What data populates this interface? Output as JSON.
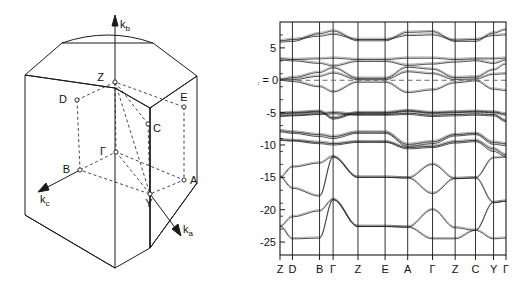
{
  "figure": {
    "panels": [
      "brillouin-zone",
      "band-structure"
    ]
  },
  "brillouin_zone": {
    "axes": [
      {
        "name": "kb",
        "base": "k",
        "sub": "b",
        "label": "k"
      },
      {
        "name": "kc",
        "base": "k",
        "sub": "c",
        "label": "k"
      },
      {
        "name": "ka",
        "base": "k",
        "sub": "a",
        "label": "k"
      }
    ],
    "axis_labels": {
      "kb": "k",
      "kb_sub": "b",
      "kc": "k",
      "kc_sub": "c",
      "ka": "k",
      "ka_sub": "a"
    },
    "points": [
      {
        "name": "Z",
        "label": "Z",
        "x": 115,
        "y": 82,
        "lx": 105,
        "ly": 80
      },
      {
        "name": "D",
        "label": "D",
        "x": 77,
        "y": 100,
        "lx": 66,
        "ly": 100
      },
      {
        "name": "E",
        "label": "E",
        "x": 184,
        "y": 107,
        "lx": 181,
        "ly": 98
      },
      {
        "name": "C",
        "label": "C",
        "x": 148,
        "y": 124,
        "lx": 153,
        "ly": 128
      },
      {
        "name": "G",
        "label": "Γ",
        "x": 116,
        "y": 152,
        "lx": 106,
        "ly": 152
      },
      {
        "name": "B",
        "label": "B",
        "x": 80,
        "y": 170,
        "lx": 68,
        "ly": 169
      },
      {
        "name": "A",
        "label": "A",
        "x": 184,
        "y": 180,
        "lx": 189,
        "ly": 184
      },
      {
        "name": "Y",
        "label": "Y",
        "x": 150,
        "y": 194,
        "lx": 148,
        "ly": 206
      }
    ]
  },
  "chart_data": {
    "type": "line",
    "title": "",
    "xlabel": "",
    "ylabel": "",
    "ylim": [
      -27,
      9
    ],
    "grid": true,
    "legend_position": "none",
    "fermi_level_label": "E",
    "fermi_level_sub": "F",
    "fermi_level_eq": "= 0",
    "fermi_level_value": 0,
    "ytick_labels": [
      "5",
      "0",
      "-5",
      "-10",
      "-15",
      "-20",
      "-25"
    ],
    "ytick_values": [
      5,
      0,
      -5,
      -10,
      -15,
      -20,
      -25
    ],
    "yminor_values": [
      7,
      3,
      1,
      -1,
      -3,
      -7,
      -9,
      -11,
      -13,
      -17,
      -19,
      -21,
      -23
    ],
    "categories": [
      "Z",
      "D",
      "B",
      "Γ",
      "Z",
      "E",
      "A",
      "Γ",
      "Z",
      "C",
      "Y",
      "Γ"
    ],
    "xtick_positions": [
      0,
      0.055,
      0.175,
      0.235,
      0.345,
      0.465,
      0.565,
      0.675,
      0.775,
      0.865,
      0.945,
      1.0
    ],
    "series": [
      {
        "name": "band-1",
        "values": [
          -22.6,
          -24.5,
          -24.4,
          -18.5,
          -22.6,
          -22.6,
          -22.7,
          -24.5,
          -24.5,
          -23.2,
          -24.5,
          -24.4
        ]
      },
      {
        "name": "band-2",
        "values": [
          -22.6,
          -21.1,
          -20.2,
          -18.4,
          -22.6,
          -22.6,
          -22.7,
          -20.0,
          -22.8,
          -23.2,
          -18.9,
          -18.7
        ]
      },
      {
        "name": "band-3",
        "values": [
          -15.0,
          -16.7,
          -17.9,
          -11.9,
          -15.0,
          -15.0,
          -15.1,
          -17.5,
          -15.2,
          -15.1,
          -18.9,
          -18.7
        ]
      },
      {
        "name": "band-4",
        "values": [
          -15.0,
          -13.4,
          -12.8,
          -11.8,
          -15.0,
          -15.0,
          -15.1,
          -13.0,
          -15.2,
          -15.1,
          -12.0,
          -11.9
        ]
      },
      {
        "name": "band-5",
        "values": [
          -9.3,
          -9.4,
          -9.8,
          -10.0,
          -9.6,
          -9.6,
          -10.6,
          -10.4,
          -9.7,
          -9.5,
          -11.0,
          -11.8
        ]
      },
      {
        "name": "band-6",
        "values": [
          -9.2,
          -9.3,
          -9.6,
          -9.8,
          -9.5,
          -9.5,
          -10.4,
          -10.2,
          -9.5,
          -9.3,
          -10.6,
          -11.5
        ]
      },
      {
        "name": "band-7",
        "values": [
          -8.0,
          -8.2,
          -8.7,
          -9.0,
          -8.2,
          -8.2,
          -10.2,
          -9.8,
          -8.6,
          -8.4,
          -9.9,
          -10.1
        ]
      },
      {
        "name": "band-8",
        "values": [
          -7.8,
          -8.0,
          -8.4,
          -8.7,
          -8.0,
          -8.0,
          -9.9,
          -9.5,
          -8.4,
          -8.2,
          -9.6,
          -9.8
        ]
      },
      {
        "name": "band-9",
        "values": [
          -5.6,
          -5.5,
          -5.3,
          -5.2,
          -5.4,
          -5.4,
          -5.3,
          -5.6,
          -5.5,
          -5.4,
          -5.5,
          -6.4
        ]
      },
      {
        "name": "band-10",
        "values": [
          -5.5,
          -5.4,
          -5.2,
          -5.0,
          -5.3,
          -5.3,
          -5.1,
          -5.4,
          -5.3,
          -5.2,
          -5.3,
          -6.2
        ]
      },
      {
        "name": "band-11",
        "values": [
          -5.2,
          -5.1,
          -4.9,
          -6.0,
          -5.1,
          -5.1,
          -4.8,
          -5.1,
          -5.0,
          -4.9,
          -5.0,
          -5.4
        ]
      },
      {
        "name": "band-12",
        "values": [
          -5.1,
          -5.0,
          -4.8,
          -5.8,
          -5.0,
          -5.0,
          -4.7,
          -5.0,
          -4.9,
          -4.8,
          -4.9,
          -5.2
        ]
      },
      {
        "name": "band-13",
        "values": [
          0.0,
          -0.2,
          -1.0,
          -1.8,
          -0.3,
          -0.3,
          -1.9,
          -1.5,
          -0.4,
          -0.1,
          -1.4,
          -1.6
        ]
      },
      {
        "name": "band-14",
        "values": [
          0.0,
          0.1,
          0.6,
          1.1,
          0.1,
          0.1,
          1.3,
          1.0,
          0.1,
          0.2,
          0.9,
          1.0
        ]
      },
      {
        "name": "band-15",
        "values": [
          0.1,
          0.4,
          1.2,
          1.9,
          0.3,
          0.3,
          2.0,
          1.7,
          0.4,
          0.5,
          1.6,
          2.5
        ]
      },
      {
        "name": "band-16",
        "values": [
          3.1,
          3.0,
          2.6,
          2.2,
          2.9,
          2.9,
          2.3,
          2.5,
          2.8,
          3.0,
          2.6,
          3.1
        ]
      },
      {
        "name": "band-17",
        "values": [
          3.3,
          3.2,
          3.3,
          3.4,
          3.2,
          3.2,
          3.4,
          3.4,
          3.2,
          3.3,
          3.3,
          3.4
        ]
      },
      {
        "name": "band-18",
        "values": [
          5.9,
          6.0,
          7.2,
          7.6,
          6.1,
          6.1,
          7.4,
          7.5,
          6.0,
          6.0,
          7.3,
          7.8
        ]
      },
      {
        "name": "band-19",
        "values": [
          6.1,
          6.3,
          6.8,
          7.1,
          6.3,
          6.3,
          6.9,
          7.0,
          6.2,
          6.3,
          6.9,
          7.0
        ]
      }
    ]
  }
}
